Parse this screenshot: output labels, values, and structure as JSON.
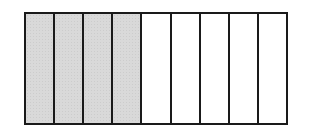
{
  "diagram": {
    "type": "fraction-bar",
    "total_parts": 9,
    "shaded_parts": 4,
    "fraction": "4/9",
    "colors": {
      "shaded": "#d9d9d9",
      "empty": "#ffffff",
      "border": "#1a1a1a"
    },
    "segments": [
      {
        "index": 1,
        "shaded": true
      },
      {
        "index": 2,
        "shaded": true
      },
      {
        "index": 3,
        "shaded": true
      },
      {
        "index": 4,
        "shaded": true
      },
      {
        "index": 5,
        "shaded": false
      },
      {
        "index": 6,
        "shaded": false
      },
      {
        "index": 7,
        "shaded": false
      },
      {
        "index": 8,
        "shaded": false
      },
      {
        "index": 9,
        "shaded": false
      }
    ]
  }
}
